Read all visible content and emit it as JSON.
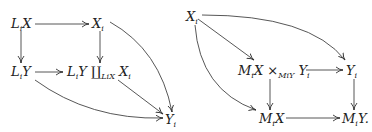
{
  "diagrams": [
    {
      "name": "left-pushout-diagram",
      "nodes": {
        "LiX": {
          "main": "L",
          "sub": "i",
          "tail": "X"
        },
        "Xi": {
          "main": "X",
          "sub": "i"
        },
        "LiY": {
          "main": "L",
          "sub": "i",
          "tail": "Y"
        },
        "pushout": {
          "a": "L",
          "a_sub": "i",
          "b": "Y",
          "coprod": "∐",
          "over": "L",
          "over_sub": "i",
          "over_tail": "X",
          "c": "X",
          "c_sub": "i"
        },
        "Yi": {
          "main": "Y",
          "sub": "i"
        }
      },
      "arrows": [
        "LiX→Xi",
        "LiX→LiY",
        "Xi→pushout",
        "LiY→pushout",
        "Xi→Yi (curved)",
        "pushout→Yi",
        "LiY→Yi (curved)"
      ]
    },
    {
      "name": "right-pullback-diagram",
      "nodes": {
        "Xi": {
          "main": "X",
          "sub": "i"
        },
        "pullback": {
          "a": "M",
          "a_sub": "i",
          "b": "X",
          "times": "×",
          "over": "M",
          "over_sub": "i",
          "over_tail": "Y",
          "c": "Y",
          "c_sub": "i"
        },
        "Yi": {
          "main": "Y",
          "sub": "i"
        },
        "MiX": {
          "main": "M",
          "sub": "i",
          "tail": "X"
        },
        "MiY": {
          "main": "M",
          "sub": "i",
          "tail": "Y."
        }
      },
      "arrows": [
        "Xi→pullback",
        "Xi→Yi (curved)",
        "Xi→MiX (curved)",
        "pullback→Yi",
        "pullback→MiX",
        "Yi→MiY",
        "MiX→MiY"
      ]
    }
  ]
}
